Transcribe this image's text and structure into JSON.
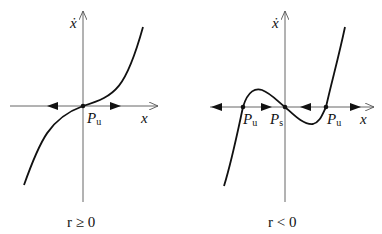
{
  "panels": [
    {
      "id": "left",
      "condition_label": "r ≥ 0",
      "y_axis_label": "ẋ",
      "x_axis_label": "x",
      "fixed_points": [
        {
          "label_main": "P",
          "label_sub": "u",
          "type": "unstable",
          "x": 0
        }
      ],
      "flow_arrows": [
        "left of P_u: leftward",
        "right of P_u: rightward"
      ]
    },
    {
      "id": "right",
      "condition_label": "r < 0",
      "y_axis_label": "ẋ",
      "x_axis_label": "x",
      "fixed_points": [
        {
          "label_main": "P",
          "label_sub": "u",
          "type": "unstable",
          "x": -1
        },
        {
          "label_main": "P",
          "label_sub": "s",
          "type": "stable",
          "x": 0
        },
        {
          "label_main": "P",
          "label_sub": "u",
          "type": "unstable",
          "x": 1
        }
      ],
      "flow_arrows": [
        "far left: leftward",
        "between P_u and P_s: rightward",
        "between P_s and P_u: leftward",
        "far right: rightward"
      ]
    }
  ]
}
